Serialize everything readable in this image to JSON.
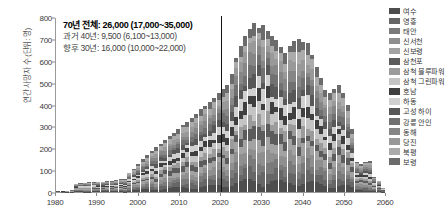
{
  "chart_data": {
    "type": "bar",
    "title": "",
    "subtitle": "",
    "xlabel": "",
    "ylabel": "연간 사망자 수 (단위: 명)",
    "xlim": [
      1980,
      2060
    ],
    "ylim": [
      0,
      800
    ],
    "grid": false,
    "legend_position": "right",
    "stacked": true,
    "y_ticks": [
      0,
      100,
      200,
      300,
      400,
      500,
      600,
      700,
      800
    ],
    "x_ticks": [
      1980,
      1990,
      2000,
      2010,
      2020,
      2030,
      2040,
      2050,
      2060
    ],
    "annotations": [
      {
        "text": "70년 전체: 26,000 (17,000~35,000)",
        "emphasis": true
      },
      {
        "text": "과거 40년: 9,500 (6,100~13,000)",
        "emphasis": false
      },
      {
        "text": "향후 30년: 16,000 (10,000~22,000)",
        "emphasis": false
      }
    ],
    "marker_line": {
      "x": 2020,
      "color": "#111111"
    },
    "series": [
      {
        "name": "여수",
        "color": "#4d4d4d"
      },
      {
        "name": "영흥",
        "color": "#666666"
      },
      {
        "name": "태안",
        "color": "#7a7a7a"
      },
      {
        "name": "신서천",
        "color": "#8f8f8f"
      },
      {
        "name": "신보령",
        "color": "#a3a3a3"
      },
      {
        "name": "삼천포",
        "color": "#5c5c5c"
      },
      {
        "name": "삼척 블루파워",
        "color": "#9b9b9b"
      },
      {
        "name": "삼척 그린파워",
        "color": "#c4c4c4"
      },
      {
        "name": "호남",
        "color": "#3f3f3f"
      },
      {
        "name": "하동",
        "color": "#d0d0d0"
      },
      {
        "name": "고성 하이",
        "color": "#585858"
      },
      {
        "name": "강릉 안인",
        "color": "#717171"
      },
      {
        "name": "동해",
        "color": "#868686"
      },
      {
        "name": "당진",
        "color": "#999999"
      },
      {
        "name": "북평",
        "color": "#ababab"
      },
      {
        "name": "보령",
        "color": "#6b6b6b"
      }
    ],
    "categories": [
      1980,
      1981,
      1982,
      1983,
      1984,
      1985,
      1986,
      1987,
      1988,
      1989,
      1990,
      1991,
      1992,
      1993,
      1994,
      1995,
      1996,
      1997,
      1998,
      1999,
      2000,
      2001,
      2002,
      2003,
      2004,
      2005,
      2006,
      2007,
      2008,
      2009,
      2010,
      2011,
      2012,
      2013,
      2014,
      2015,
      2016,
      2017,
      2018,
      2019,
      2020,
      2021,
      2022,
      2023,
      2024,
      2025,
      2026,
      2027,
      2028,
      2029,
      2030,
      2031,
      2032,
      2033,
      2034,
      2035,
      2036,
      2037,
      2038,
      2039,
      2040,
      2041,
      2042,
      2043,
      2044,
      2045,
      2046,
      2047,
      2048,
      2049,
      2050,
      2051,
      2052,
      2053
    ],
    "values": [
      4,
      5,
      6,
      10,
      38,
      42,
      44,
      45,
      46,
      47,
      48,
      50,
      52,
      55,
      58,
      62,
      90,
      108,
      128,
      150,
      168,
      188,
      205,
      222,
      240,
      258,
      272,
      288,
      305,
      322,
      340,
      358,
      378,
      395,
      412,
      432,
      452,
      470,
      492,
      540,
      615,
      668,
      712,
      748,
      775,
      752,
      762,
      738,
      716,
      695,
      665,
      635,
      668,
      690,
      700,
      688,
      680,
      628,
      572,
      520,
      466,
      452,
      470,
      490,
      452,
      398,
      288,
      138,
      130,
      138,
      142,
      70,
      52,
      20
    ],
    "stack_breakdown_note": "각 막대는 발전소별 기여분으로 적층됨"
  }
}
